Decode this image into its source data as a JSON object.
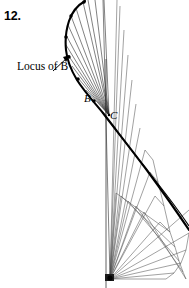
{
  "figure": {
    "problem_number": "12.",
    "labels": {
      "locus": "Locus of B",
      "point_b": "B",
      "point_c": "C"
    },
    "colors": {
      "ink": "#000000",
      "thin_line": "#4a4a4a",
      "background": "#ffffff"
    },
    "geometry": {
      "width": 189,
      "height": 288,
      "ground_pivot": [
        110,
        279
      ],
      "fixed_pivot_c": [
        109,
        115
      ],
      "point_b": [
        95,
        104
      ],
      "vertical_guide_line": [
        [
          106,
          59
        ],
        [
          106,
          288
        ]
      ],
      "locus_curve_points": [
        [
          83,
          2
        ],
        [
          76,
          8
        ],
        [
          71,
          16
        ],
        [
          68,
          25
        ],
        [
          66,
          35
        ],
        [
          66,
          45
        ],
        [
          68,
          55
        ],
        [
          72,
          66
        ],
        [
          78,
          78
        ],
        [
          86,
          90
        ],
        [
          95,
          104
        ],
        [
          106,
          118
        ],
        [
          118,
          134
        ],
        [
          132,
          152
        ],
        [
          146,
          171
        ],
        [
          160,
          190
        ],
        [
          174,
          210
        ],
        [
          189,
          232
        ]
      ],
      "locus_marker_points": [
        [
          83,
          2
        ],
        [
          71,
          16
        ],
        [
          66,
          35
        ],
        [
          68,
          55
        ],
        [
          78,
          78
        ],
        [
          95,
          104
        ]
      ],
      "crank_rays_from_c": [
        [
          88,
          0
        ],
        [
          83,
          2
        ],
        [
          76,
          8
        ],
        [
          71,
          16
        ],
        [
          68,
          25
        ],
        [
          66,
          35
        ],
        [
          66,
          45
        ],
        [
          68,
          55
        ],
        [
          72,
          66
        ],
        [
          78,
          78
        ],
        [
          86,
          90
        ],
        [
          95,
          104
        ]
      ],
      "long_arms_from_c": [
        [
          103,
          0
        ],
        [
          93,
          0
        ],
        [
          84,
          3
        ]
      ],
      "fan_rays_from_ground": [
        [
          189,
          233
        ],
        [
          185,
          249
        ],
        [
          180,
          262
        ],
        [
          173,
          272
        ],
        [
          165,
          279
        ],
        [
          160,
          222
        ],
        [
          155,
          196
        ],
        [
          150,
          172
        ],
        [
          145,
          150
        ],
        [
          140,
          128
        ],
        [
          136,
          104
        ],
        [
          132,
          80
        ],
        [
          128,
          55
        ],
        [
          124,
          30
        ],
        [
          120,
          6
        ]
      ],
      "coupler_chevrons": [
        [
          [
            110,
            279
          ],
          [
            119,
            196
          ],
          [
            172,
            237
          ]
        ],
        [
          [
            110,
            279
          ],
          [
            124,
            199
          ],
          [
            176,
            252
          ]
        ],
        [
          [
            110,
            279
          ],
          [
            131,
            203
          ],
          [
            180,
            266
          ]
        ],
        [
          [
            110,
            279
          ],
          [
            139,
            207
          ],
          [
            183,
            276
          ]
        ]
      ],
      "leader_arrow": {
        "from": [
          53,
          70
        ],
        "to": [
          70,
          55
        ]
      }
    }
  }
}
